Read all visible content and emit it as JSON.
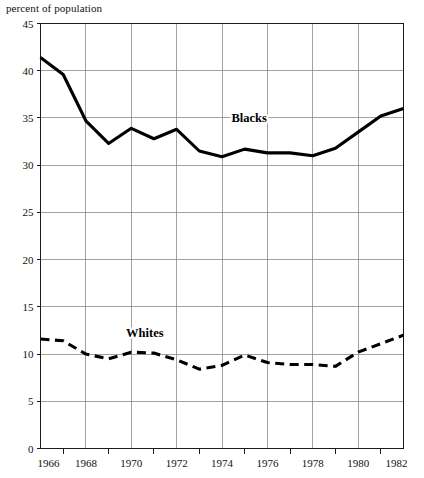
{
  "chart_data": {
    "type": "line",
    "title": "percent of population",
    "xlabel": "",
    "ylabel": "percent of population",
    "xlim": [
      1966,
      1982
    ],
    "ylim": [
      0,
      45
    ],
    "grid": true,
    "legend_position": "inline",
    "y_ticks": [
      0,
      5,
      10,
      15,
      20,
      25,
      30,
      35,
      40,
      45
    ],
    "y_tick_labels": [
      "0",
      "5",
      "10",
      "15",
      "20",
      "25",
      "30",
      "35",
      "40",
      "45"
    ],
    "x_ticks": [
      1966,
      1968,
      1970,
      1972,
      1974,
      1976,
      1978,
      1980,
      1982
    ],
    "x_tick_labels": [
      "1966",
      "1968",
      "1970",
      "1972",
      "1974",
      "1976",
      "1978",
      "1980",
      "1982"
    ],
    "x_minor_ticks": [
      1967,
      1969,
      1971,
      1973,
      1975,
      1977,
      1979,
      1981
    ],
    "x": [
      1966,
      1967,
      1968,
      1969,
      1970,
      1971,
      1972,
      1973,
      1974,
      1975,
      1976,
      1977,
      1978,
      1979,
      1980,
      1981,
      1982
    ],
    "series": [
      {
        "name": "Blacks",
        "style": "solid",
        "color": "#000000",
        "label_x": 1975.2,
        "label_y": 34.6,
        "values": [
          41.4,
          39.6,
          34.7,
          32.3,
          33.9,
          32.8,
          33.8,
          31.5,
          30.9,
          31.7,
          31.3,
          31.3,
          31.0,
          31.8,
          33.5,
          35.2,
          36.0
        ]
      },
      {
        "name": "Whites",
        "style": "dashed",
        "color": "#000000",
        "label_x": 1970.6,
        "label_y": 11.8,
        "values": [
          11.6,
          11.4,
          10.0,
          9.5,
          10.2,
          10.1,
          9.4,
          8.4,
          8.8,
          9.9,
          9.1,
          8.9,
          8.9,
          8.7,
          10.2,
          11.1,
          12.0
        ]
      }
    ]
  },
  "caption": ""
}
